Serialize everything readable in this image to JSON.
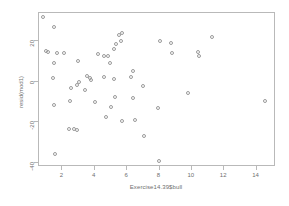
{
  "chart_data": {
    "type": "scatter",
    "title": "",
    "xlabel": "Exercise14.39$bull",
    "ylabel": "resid(mod1)",
    "xlim": [
      0.55,
      15.2
    ],
    "ylim": [
      -42,
      34
    ],
    "xticks": [
      2,
      4,
      6,
      8,
      10,
      12,
      14
    ],
    "xtick_labels": [
      "2",
      "4",
      "6",
      "8",
      "10",
      "12",
      "14"
    ],
    "yticks": [
      20,
      0,
      -20,
      -40
    ],
    "ytick_labels": [
      "20",
      "0",
      "-20",
      "-40"
    ],
    "grid": false,
    "legend": false,
    "marker": "open-circle",
    "marker_color": "#9a9a9a",
    "frame_color": "#b9b9b9",
    "background": "#ffffff",
    "n_points": 58,
    "points": [
      {
        "x": 0.85,
        "y": 31.5
      },
      {
        "x": 1.55,
        "y": 26.8
      },
      {
        "x": 1.05,
        "y": 15.0
      },
      {
        "x": 1.15,
        "y": 14.4
      },
      {
        "x": 1.75,
        "y": 13.6
      },
      {
        "x": 2.15,
        "y": 14.0
      },
      {
        "x": 1.55,
        "y": 8.6
      },
      {
        "x": 1.45,
        "y": 1.5
      },
      {
        "x": 1.55,
        "y": -11.8
      },
      {
        "x": 1.6,
        "y": -36.0
      },
      {
        "x": 2.55,
        "y": -10.0
      },
      {
        "x": 2.45,
        "y": -23.6
      },
      {
        "x": 2.75,
        "y": -23.9
      },
      {
        "x": 2.95,
        "y": -24.2
      },
      {
        "x": 2.6,
        "y": -3.4
      },
      {
        "x": 3.05,
        "y": 9.6
      },
      {
        "x": 3.1,
        "y": -0.6
      },
      {
        "x": 2.95,
        "y": -1.9
      },
      {
        "x": 3.45,
        "y": -4.6
      },
      {
        "x": 3.55,
        "y": 2.2
      },
      {
        "x": 3.75,
        "y": 1.3
      },
      {
        "x": 3.8,
        "y": 0.2
      },
      {
        "x": 4.25,
        "y": 13.2
      },
      {
        "x": 4.05,
        "y": -10.3
      },
      {
        "x": 4.75,
        "y": -18.0
      },
      {
        "x": 4.65,
        "y": 12.2
      },
      {
        "x": 4.85,
        "y": 12.1
      },
      {
        "x": 4.6,
        "y": 1.8
      },
      {
        "x": 5.0,
        "y": 8.6
      },
      {
        "x": 5.05,
        "y": -13.0
      },
      {
        "x": 5.3,
        "y": -8.0
      },
      {
        "x": 5.25,
        "y": 0.8
      },
      {
        "x": 5.25,
        "y": 15.8
      },
      {
        "x": 5.35,
        "y": 18.4
      },
      {
        "x": 5.55,
        "y": 22.8
      },
      {
        "x": 5.75,
        "y": 23.4
      },
      {
        "x": 5.65,
        "y": 19.8
      },
      {
        "x": 5.75,
        "y": -19.6
      },
      {
        "x": 6.3,
        "y": 2.0
      },
      {
        "x": 6.45,
        "y": 4.8
      },
      {
        "x": 6.4,
        "y": -8.6
      },
      {
        "x": 6.55,
        "y": -19.2
      },
      {
        "x": 7.05,
        "y": -2.7
      },
      {
        "x": 7.1,
        "y": -27.4
      },
      {
        "x": 7.95,
        "y": -13.6
      },
      {
        "x": 8.1,
        "y": 19.7
      },
      {
        "x": 8.0,
        "y": -39.6
      },
      {
        "x": 8.75,
        "y": 18.6
      },
      {
        "x": 8.85,
        "y": 13.6
      },
      {
        "x": 9.85,
        "y": -5.8
      },
      {
        "x": 10.45,
        "y": 14.2
      },
      {
        "x": 10.5,
        "y": 12.4
      },
      {
        "x": 11.3,
        "y": 21.6
      },
      {
        "x": 14.6,
        "y": -9.8
      }
    ]
  }
}
